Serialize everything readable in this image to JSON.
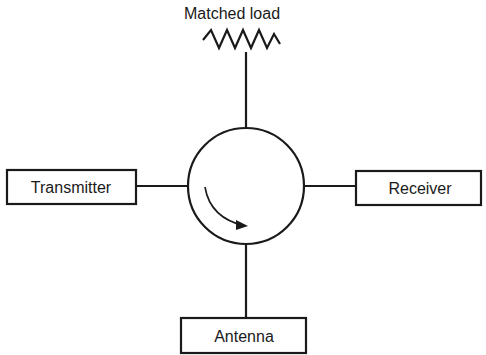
{
  "diagram": {
    "type": "circulator",
    "colors": {
      "stroke": "#1a1a1a",
      "background": "#ffffff"
    },
    "nodes": {
      "top": {
        "label": "Matched load",
        "symbol": "resistor-zigzag"
      },
      "left": {
        "label": "Transmitter"
      },
      "right": {
        "label": "Receiver"
      },
      "bottom": {
        "label": "Antenna"
      }
    },
    "center": {
      "symbol": "circle",
      "arrow_direction": "clockwise"
    }
  }
}
